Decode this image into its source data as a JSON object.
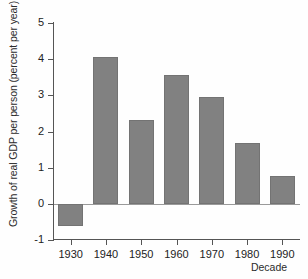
{
  "chart_data": {
    "type": "bar",
    "title": "",
    "xlabel": "Decade",
    "ylabel": "Growth of real GDP per person (percent per year)",
    "categories": [
      "1930",
      "1940",
      "1950",
      "1960",
      "1970",
      "1980",
      "1990"
    ],
    "values": [
      -0.6,
      4.05,
      2.33,
      3.57,
      2.95,
      1.68,
      0.78
    ],
    "ylim": [
      -1,
      5
    ],
    "ytick_labels": [
      "5",
      "4",
      "3",
      "2",
      "1",
      "0",
      "-1"
    ],
    "ytick_values": [
      5,
      4,
      3,
      2,
      1,
      0,
      -1
    ],
    "xtick_labels": [
      "1930",
      "1940",
      "1950",
      "1960",
      "1970",
      "1980",
      "1990"
    ],
    "grid": false,
    "legend": "none",
    "bar_color": "#818181",
    "bar_edge_color": "#737373",
    "axis_color": "#555555",
    "background_color": "#fefefe",
    "zero_line": 0
  }
}
